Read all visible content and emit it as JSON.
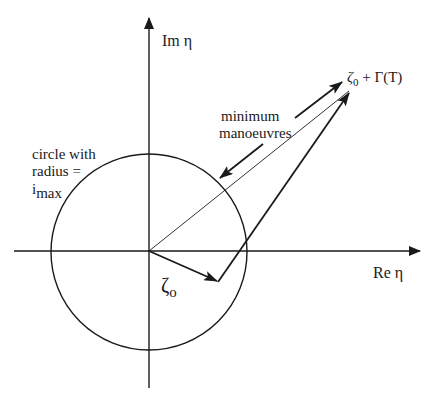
{
  "diagram": {
    "axes": {
      "imaginary_label": "Im η",
      "real_label": "Re η"
    },
    "circle_label": {
      "line1": "circle with",
      "line2": "radius =",
      "line3_main": "i",
      "line3_sub": "max"
    },
    "vector_label": {
      "main": "ζ",
      "sub": "o"
    },
    "endpoint_label": {
      "zeta": "ζ",
      "sub": "0",
      "rest": " + Γ(T)"
    },
    "annotation": {
      "line1": "minimum",
      "line2": "manoeuvres"
    },
    "colors": {
      "ink": "#1a1a1a",
      "background": "#ffffff"
    }
  }
}
